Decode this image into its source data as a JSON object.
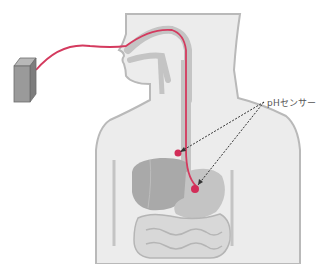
{
  "diagram": {
    "labels": {
      "sensor": "pHセンサー"
    },
    "colors": {
      "body_fill": "#ececec",
      "body_outline": "#b9b9b9",
      "organ_fill": "#c4c4c4",
      "organ_dark": "#a9a9a9",
      "catheter": "#d43a5e",
      "sensor_dot": "#d22d58",
      "device_front": "#9a9a9a",
      "device_side": "#7d7d7d",
      "device_top": "#b8b8b8",
      "arrow": "#333333"
    },
    "components": [
      "recorder-device",
      "catheter",
      "human-torso",
      "esophagus",
      "stomach",
      "liver",
      "intestines",
      "sensor-upper",
      "sensor-lower"
    ]
  }
}
